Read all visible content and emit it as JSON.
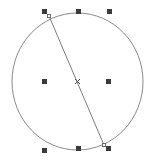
{
  "canvas": {
    "width": 149,
    "height": 162,
    "background_color": "#ffffff",
    "label": "Drawing canvas"
  },
  "colors": {
    "shape_stroke": "#8a8a8a",
    "chord_stroke": "#7d7d7d",
    "handle_fill": "#3a3a3a",
    "node_fill": "#ffffff",
    "node_stroke": "#6b6b6b",
    "center_marker": "#4a4a4a",
    "background": "#ffffff"
  },
  "shape": {
    "type": "ellipse",
    "name": "circle-outline",
    "center_x": 77.5,
    "center_y": 81.5,
    "radius_x": 65.5,
    "radius_y": 68.5,
    "stroke_width": 1,
    "fill": "none"
  },
  "chord": {
    "type": "line",
    "name": "chord-line",
    "x1": 49,
    "y1": 16,
    "x2": 104,
    "y2": 145,
    "stroke_width": 1
  },
  "center_marker": {
    "label": "rotation-center",
    "x": 77.5,
    "y": 81.5,
    "glyph": "x"
  },
  "selection_handles": [
    {
      "id": "handle-top-left",
      "label": "Top left resize handle",
      "x": 44,
      "y": 11,
      "size": 5
    },
    {
      "id": "handle-top-center",
      "label": "Top center resize handle",
      "x": 78,
      "y": 11,
      "size": 5
    },
    {
      "id": "handle-top-right",
      "label": "Top right resize handle",
      "x": 109,
      "y": 11,
      "size": 5
    },
    {
      "id": "handle-middle-left",
      "label": "Middle left resize handle",
      "x": 44,
      "y": 81,
      "size": 5
    },
    {
      "id": "handle-middle-right",
      "label": "Middle right resize handle",
      "x": 108,
      "y": 81,
      "size": 5
    },
    {
      "id": "handle-bottom-left",
      "label": "Bottom left resize handle",
      "x": 44,
      "y": 150,
      "size": 5
    },
    {
      "id": "handle-bottom-center",
      "label": "Bottom center resize handle",
      "x": 78,
      "y": 148,
      "size": 5
    },
    {
      "id": "handle-bottom-right",
      "label": "Bottom right resize handle",
      "x": 108,
      "y": 148,
      "size": 5
    }
  ],
  "path_nodes": [
    {
      "id": "node-start",
      "label": "Chord start node",
      "x": 49,
      "y": 16
    },
    {
      "id": "node-end",
      "label": "Chord end node",
      "x": 104,
      "y": 145
    }
  ]
}
